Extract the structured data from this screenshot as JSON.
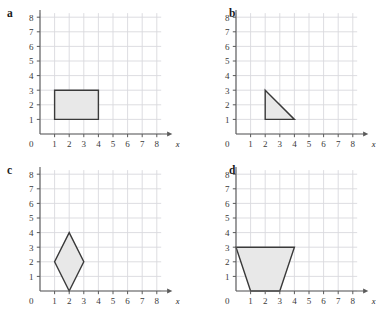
{
  "figure": {
    "background": "#ffffff",
    "grid_color": "#d9d9de",
    "axis_color": "#5a5a5a",
    "shape_stroke": "#3a3a3a",
    "shape_fill": "#e8e8e8",
    "tick_label_color": "#3a3a3a"
  },
  "axes": {
    "origin_label": "0",
    "x_axis_label": "x",
    "y_axis_label": "y",
    "x_ticks": [
      "1",
      "2",
      "3",
      "4",
      "5",
      "6",
      "7",
      "8"
    ],
    "y_ticks": [
      "1",
      "2",
      "3",
      "4",
      "5",
      "6",
      "7",
      "8"
    ],
    "x_range": [
      0,
      8
    ],
    "y_range": [
      0,
      8
    ]
  },
  "panels": [
    {
      "id": "a",
      "label": "a",
      "shape_name": "rectangle",
      "vertices": [
        [
          1,
          1
        ],
        [
          4,
          1
        ],
        [
          4,
          3
        ],
        [
          1,
          3
        ]
      ]
    },
    {
      "id": "b",
      "label": "b",
      "shape_name": "right-triangle",
      "vertices": [
        [
          2,
          3
        ],
        [
          4,
          1
        ],
        [
          2,
          1
        ]
      ]
    },
    {
      "id": "c",
      "label": "c",
      "shape_name": "rhombus",
      "vertices": [
        [
          2,
          4
        ],
        [
          3,
          2
        ],
        [
          2,
          0
        ],
        [
          1,
          2
        ]
      ]
    },
    {
      "id": "d",
      "label": "d",
      "shape_name": "trapezoid",
      "vertices": [
        [
          0,
          3
        ],
        [
          4,
          3
        ],
        [
          3,
          0
        ],
        [
          1,
          0
        ]
      ]
    }
  ]
}
